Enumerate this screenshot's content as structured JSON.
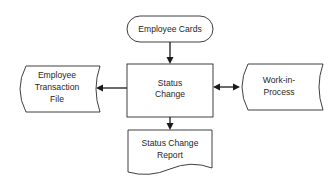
{
  "diagram": {
    "type": "flowchart",
    "nodes": [
      {
        "id": "employee_cards",
        "shape": "terminal",
        "lines": [
          "Employee Cards"
        ]
      },
      {
        "id": "status_change",
        "shape": "process",
        "lines": [
          "Status",
          "Change"
        ]
      },
      {
        "id": "employee_transaction_file",
        "shape": "stored-data",
        "lines": [
          "Employee",
          "Transaction",
          "File"
        ]
      },
      {
        "id": "work_in_process",
        "shape": "stored-data",
        "lines": [
          "Work-in-",
          "Process"
        ]
      },
      {
        "id": "status_change_report",
        "shape": "document",
        "lines": [
          "Status Change",
          "Report"
        ]
      }
    ],
    "edges": [
      {
        "from": "employee_cards",
        "to": "status_change",
        "direction": "one-way"
      },
      {
        "from": "status_change",
        "to": "employee_transaction_file",
        "direction": "one-way"
      },
      {
        "from": "status_change",
        "to": "work_in_process",
        "direction": "two-way"
      },
      {
        "from": "status_change",
        "to": "status_change_report",
        "direction": "one-way"
      }
    ],
    "colors": {
      "line": "#1a1a1a",
      "text": "#262626",
      "background": "#ffffff"
    }
  }
}
